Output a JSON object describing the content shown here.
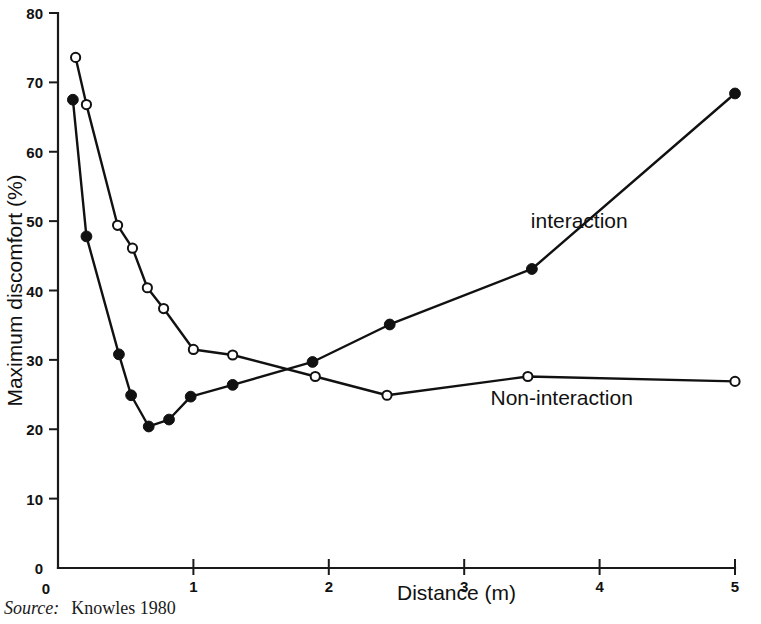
{
  "figure": {
    "source_prefix": "Source:",
    "source_reference": "Knowles 1980"
  },
  "chart_data": {
    "type": "line",
    "title": "",
    "xlabel": "Distance (m)",
    "ylabel": "Maximum discomfort (%)",
    "xlim": [
      0,
      5
    ],
    "ylim": [
      0,
      80
    ],
    "xticks": [
      0,
      1,
      2,
      3,
      4,
      5
    ],
    "xtick_labels": [
      "0",
      "1",
      "2",
      "3",
      "4",
      "5"
    ],
    "yticks": [
      0,
      10,
      20,
      30,
      40,
      50,
      60,
      70,
      80
    ],
    "ytick_labels": [
      "0",
      "10",
      "20",
      "30",
      "40",
      "50",
      "60",
      "70",
      "80"
    ],
    "grid": false,
    "legend_position": "inline-annotations",
    "series": [
      {
        "name": "interaction",
        "marker": "filled-circle",
        "label_text": "interaction",
        "points": [
          {
            "x": 0.11,
            "y": 67.5
          },
          {
            "x": 0.21,
            "y": 47.8
          },
          {
            "x": 0.45,
            "y": 30.8
          },
          {
            "x": 0.54,
            "y": 24.9
          },
          {
            "x": 0.67,
            "y": 20.4
          },
          {
            "x": 0.82,
            "y": 21.4
          },
          {
            "x": 0.98,
            "y": 24.7
          },
          {
            "x": 1.29,
            "y": 26.4
          },
          {
            "x": 1.88,
            "y": 29.7
          },
          {
            "x": 2.45,
            "y": 35.1
          },
          {
            "x": 3.5,
            "y": 43.1
          },
          {
            "x": 5.0,
            "y": 68.4
          }
        ]
      },
      {
        "name": "Non-interaction",
        "marker": "open-circle",
        "label_text": "Non-interaction",
        "points": [
          {
            "x": 0.13,
            "y": 73.6
          },
          {
            "x": 0.21,
            "y": 66.8
          },
          {
            "x": 0.44,
            "y": 49.4
          },
          {
            "x": 0.55,
            "y": 46.1
          },
          {
            "x": 0.66,
            "y": 40.4
          },
          {
            "x": 0.78,
            "y": 37.4
          },
          {
            "x": 1.0,
            "y": 31.5
          },
          {
            "x": 1.29,
            "y": 30.7
          },
          {
            "x": 1.9,
            "y": 27.6
          },
          {
            "x": 2.43,
            "y": 24.9
          },
          {
            "x": 3.47,
            "y": 27.6
          },
          {
            "x": 5.0,
            "y": 26.9
          }
        ]
      }
    ],
    "annotations": [
      {
        "text": "interaction",
        "x": 3.85,
        "y": 49.0
      },
      {
        "text": "Non-interaction",
        "x": 3.72,
        "y": 23.5
      }
    ]
  }
}
